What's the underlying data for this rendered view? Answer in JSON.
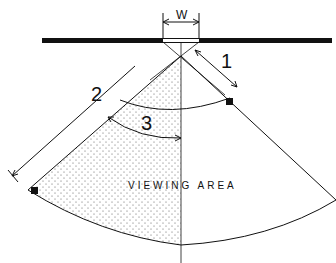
{
  "diagram": {
    "labels": {
      "width": "W",
      "dim1": "1",
      "dim2": "2",
      "dim3": "3",
      "area": "VIEWING AREA"
    },
    "colors": {
      "ink": "#111111",
      "background": "#ffffff",
      "stipple": "#555555"
    }
  }
}
